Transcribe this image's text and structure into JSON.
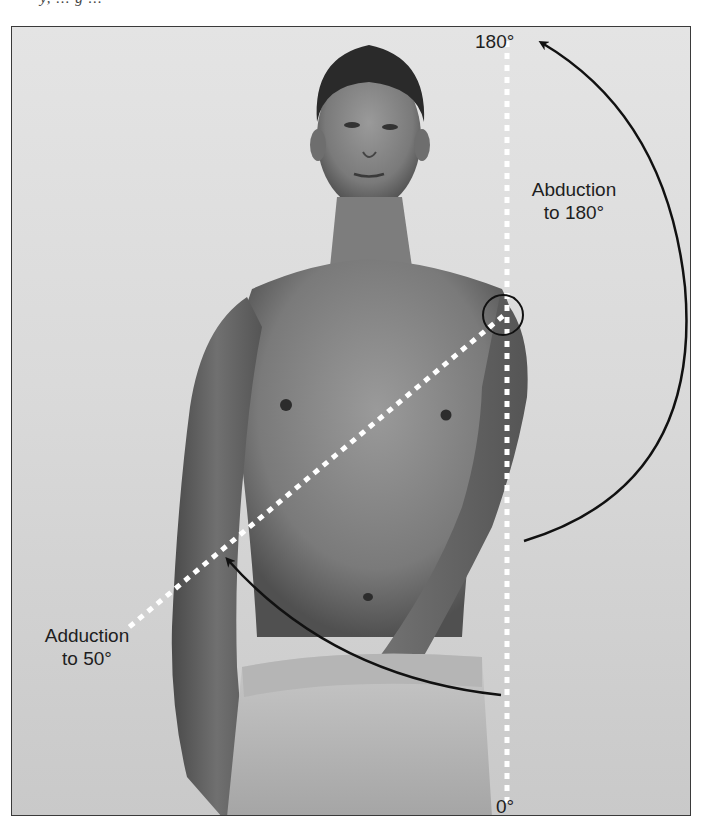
{
  "caption_fragment": "y, ... g ...",
  "figure": {
    "labels": {
      "top_angle": "180°",
      "bottom_angle": "0°",
      "abduction_line1": "Abduction",
      "abduction_line2": "to 180°",
      "adduction_line1": "Adduction",
      "adduction_line2": "to 50°"
    },
    "overlays": {
      "vertical_reference_line": "white dotted line from 0° to 180°",
      "diagonal_line": "white dotted line from shoulder to adduction 50°",
      "joint_marker": "black circle at shoulder joint",
      "abduction_arrow": "curved black arrow pointing up to 180°",
      "adduction_arrow": "curved black arrow pointing to 50° line"
    },
    "colors": {
      "background": "#dcdcdc",
      "frame_border": "#3a3a3a",
      "arrow": "#111111",
      "dotted_line": "#ffffff"
    }
  }
}
